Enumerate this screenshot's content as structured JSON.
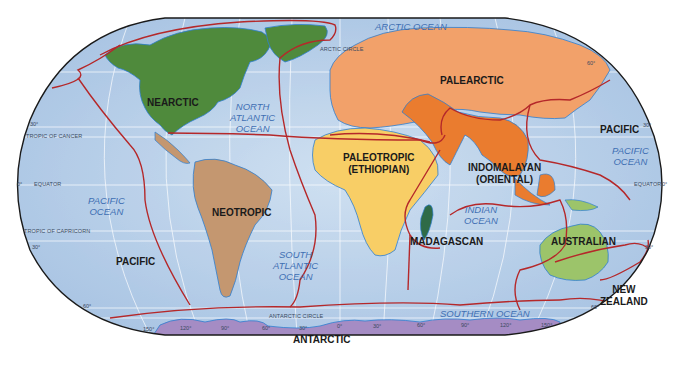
{
  "map": {
    "title": "Zoogeographic Realms of the World",
    "projection": "Robinson",
    "realms": [
      {
        "id": "nearctic",
        "label": "NEARCTIC",
        "color": "#4f8a3c"
      },
      {
        "id": "palearctic",
        "label": "PALEARCTIC",
        "color": "#f2a16a"
      },
      {
        "id": "neotropic",
        "label": "NEOTROPIC",
        "color": "#c49770"
      },
      {
        "id": "paleotropic",
        "label_line1": "PALEOTROPIC",
        "label_line2": "(ETHIOPIAN)",
        "color": "#f8ce66"
      },
      {
        "id": "indomalayan",
        "label_line1": "INDOMALAYAN",
        "label_line2": "(ORIENTAL)",
        "color": "#ea7c2f"
      },
      {
        "id": "madagascan",
        "label": "MADAGASCAN",
        "color": "#2f6b47"
      },
      {
        "id": "australian",
        "label": "AUSTRALIAN",
        "color": "#9cc46a"
      },
      {
        "id": "new_zealand",
        "label_line1": "NEW",
        "label_line2": "ZEALAND",
        "color": "#b04a5a"
      },
      {
        "id": "antarctic",
        "label": "ANTARCTIC",
        "color": "#a58cc4"
      },
      {
        "id": "pacific_west",
        "label": "PACIFIC"
      },
      {
        "id": "pacific_east",
        "label": "PACIFIC"
      }
    ],
    "oceans": [
      {
        "id": "arctic",
        "label": "ARCTIC OCEAN"
      },
      {
        "id": "north_atlantic",
        "line1": "NORTH",
        "line2": "ATLANTIC",
        "line3": "OCEAN"
      },
      {
        "id": "south_atlantic",
        "line1": "SOUTH",
        "line2": "ATLANTIC",
        "line3": "OCEAN"
      },
      {
        "id": "pacific_west",
        "line1": "PACIFIC",
        "line2": "OCEAN"
      },
      {
        "id": "pacific_east",
        "line1": "PACIFIC",
        "line2": "OCEAN"
      },
      {
        "id": "indian",
        "line1": "INDIAN",
        "line2": "OCEAN"
      },
      {
        "id": "southern",
        "label": "SOUTHERN OCEAN"
      }
    ],
    "reference_lines": {
      "arctic_circle": "ARCTIC CIRCLE",
      "tropic_of_cancer": "TROPIC OF CANCER",
      "equator_left": "EQUATOR",
      "equator_right": "EQUATOR",
      "tropic_of_capricorn": "TROPIC OF CAPRICORN",
      "antarctic_circle": "ANTARCTIC CIRCLE"
    },
    "degree_ticks": {
      "left_30n": "30°",
      "left_0": "0°",
      "left_30s": "30°",
      "left_60s": "60°",
      "right_60n": "60°",
      "right_30n": "30°",
      "right_0": "0°",
      "right_30s": "30°",
      "right_60s": "60°",
      "bottom_150w": "150°",
      "bottom_120w": "120°",
      "bottom_90w": "90°",
      "bottom_60w": "60°",
      "bottom_30w": "30°",
      "bottom_0": "0°",
      "bottom_30e": "30°",
      "bottom_60e": "60°",
      "bottom_90e": "90°",
      "bottom_120e": "120°",
      "bottom_150e": "150°"
    },
    "colors": {
      "ocean": "#b9d0e8",
      "ocean_light": "#dbe8f5",
      "boundary": "#b5282a",
      "coast": "#2f7fd0",
      "graticule": "#ffffff",
      "outline": "#1a1a1a"
    }
  }
}
